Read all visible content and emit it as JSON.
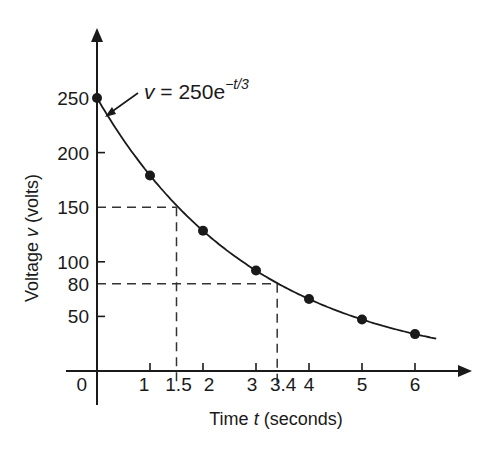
{
  "chart_data": {
    "type": "line",
    "title": "",
    "xlabel": "Time t (seconds)",
    "ylabel": "Voltage v (volts)",
    "x_ticks": [
      {
        "value": 0,
        "label": "0"
      },
      {
        "value": 1,
        "label": "1"
      },
      {
        "value": 1.5,
        "label": "1.5"
      },
      {
        "value": 2,
        "label": "2"
      },
      {
        "value": 3,
        "label": "3"
      },
      {
        "value": 3.4,
        "label": "3.4"
      },
      {
        "value": 4,
        "label": "4"
      },
      {
        "value": 5,
        "label": "5"
      },
      {
        "value": 6,
        "label": "6"
      }
    ],
    "y_ticks": [
      {
        "value": 50,
        "label": "50"
      },
      {
        "value": 80,
        "label": "80"
      },
      {
        "value": 100,
        "label": "100"
      },
      {
        "value": 150,
        "label": "150"
      },
      {
        "value": 200,
        "label": "200"
      },
      {
        "value": 250,
        "label": "250"
      }
    ],
    "xlim": [
      0,
      6.5
    ],
    "ylim": [
      0,
      280
    ],
    "grid": false,
    "legend": null,
    "series": [
      {
        "name": "v = 250e^(-t/3)",
        "kind": "curve",
        "equation": {
          "amplitude": 250,
          "time_constant": 3
        },
        "x_range": [
          0,
          6.4
        ]
      },
      {
        "name": "measured points",
        "kind": "scatter",
        "x": [
          0,
          1,
          2,
          3,
          4,
          5,
          6
        ],
        "y": [
          250,
          179.1,
          128.4,
          92.0,
          65.9,
          47.2,
          33.8
        ]
      }
    ],
    "reference_lines": [
      {
        "x": 1.5,
        "y": 150,
        "style": "dashed"
      },
      {
        "x": 3.4,
        "y": 80,
        "style": "dashed"
      }
    ],
    "annotations": [
      {
        "text_main": "v = 250e",
        "text_superscript": "−t/3",
        "points_to": {
          "x": 0.2,
          "y": 234
        }
      }
    ]
  },
  "labels": {
    "xlabel_prefix": "Time ",
    "xlabel_var": "t",
    "xlabel_suffix": " (seconds)",
    "ylabel_prefix": "Voltage ",
    "ylabel_var": "v",
    "ylabel_suffix": " (volts)",
    "eq_var": "v",
    "eq_rest": " = 250e",
    "eq_sup": "−t/3",
    "origin": "0"
  },
  "colors": {
    "ink": "#1a1a1a",
    "dash": "#333333",
    "background": "#ffffff"
  }
}
